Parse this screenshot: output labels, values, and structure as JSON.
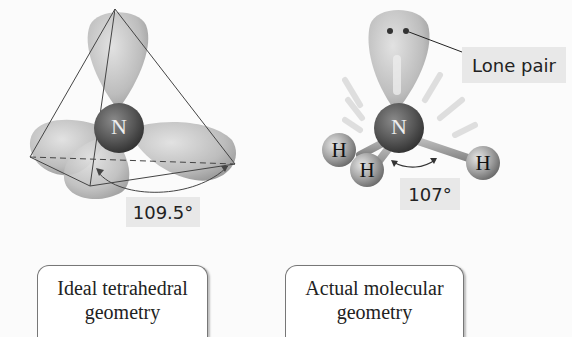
{
  "left_panel": {
    "central_atom": "N",
    "angle_label": "109.5°",
    "caption_line1": "Ideal tetrahedral",
    "caption_line2": "geometry"
  },
  "right_panel": {
    "central_atom": "N",
    "hydrogen_labels": [
      "H",
      "H",
      "H"
    ],
    "lone_pair_label": "Lone pair",
    "angle_label": "107°",
    "caption_line1": "Actual molecular",
    "caption_line2": "geometry"
  },
  "colors": {
    "orbital": "#c4c4c4",
    "atom": "#555555",
    "label_bg": "#e8e8e8",
    "line": "#444444"
  }
}
